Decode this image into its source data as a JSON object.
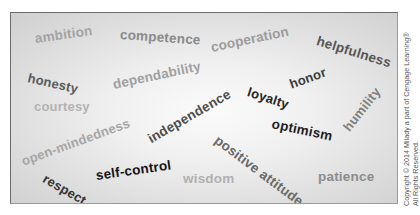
{
  "words": [
    {
      "text": "ambition",
      "x": 34,
      "y": 38,
      "size": 13.5,
      "rotate": -8,
      "color": "#a3a3a3"
    },
    {
      "text": "competence",
      "x": 119,
      "y": 34,
      "size": 13.5,
      "rotate": 4,
      "color": "#8a8a8a"
    },
    {
      "text": "cooperation",
      "x": 210,
      "y": 47,
      "size": 13.5,
      "rotate": -12,
      "color": "#9c9c9c"
    },
    {
      "text": "helpfulness",
      "x": 316,
      "y": 40,
      "size": 13.5,
      "rotate": 17,
      "color": "#555555"
    },
    {
      "text": "honesty",
      "x": 27,
      "y": 76,
      "size": 13,
      "rotate": 13,
      "color": "#5a5a5a"
    },
    {
      "text": "dependability",
      "x": 112,
      "y": 84,
      "size": 13.5,
      "rotate": -12,
      "color": "#a0a0a0"
    },
    {
      "text": "loyalty",
      "x": 247,
      "y": 90,
      "size": 13,
      "rotate": 18,
      "color": "#262626"
    },
    {
      "text": "honor",
      "x": 289,
      "y": 83,
      "size": 13,
      "rotate": -20,
      "color": "#3c3c3c"
    },
    {
      "text": "courtesy",
      "x": 33,
      "y": 105,
      "size": 13,
      "rotate": 0,
      "color": "#b3b3b3"
    },
    {
      "text": "humility",
      "x": 345,
      "y": 128,
      "size": 13,
      "rotate": -52,
      "color": "#7f7f7f"
    },
    {
      "text": "independence",
      "x": 148,
      "y": 139,
      "size": 13.5,
      "rotate": -30,
      "color": "#4d4d4d"
    },
    {
      "text": "optimism",
      "x": 271,
      "y": 123,
      "size": 13.5,
      "rotate": 12,
      "color": "#1e1e1e"
    },
    {
      "text": "open-mindedness",
      "x": 21,
      "y": 160,
      "size": 13,
      "rotate": -20,
      "color": "#a5a5a5"
    },
    {
      "text": "positive attitude",
      "x": 215,
      "y": 138,
      "size": 13.5,
      "rotate": 37,
      "color": "#6a6a6a"
    },
    {
      "text": "self-control",
      "x": 95,
      "y": 175,
      "size": 13.5,
      "rotate": -8,
      "color": "#161616"
    },
    {
      "text": "respect",
      "x": 43,
      "y": 176,
      "size": 13,
      "rotate": 30,
      "color": "#333333"
    },
    {
      "text": "wisdom",
      "x": 182,
      "y": 178,
      "size": 13.5,
      "rotate": 0,
      "color": "#b0b0b0"
    },
    {
      "text": "patience",
      "x": 317,
      "y": 176,
      "size": 13.5,
      "rotate": 0,
      "color": "#8c8c8c"
    }
  ],
  "copyright": {
    "line1": "Copyright © 2014 Milady a part of Cengage Learning®",
    "line2": "All Rights Reserved."
  }
}
